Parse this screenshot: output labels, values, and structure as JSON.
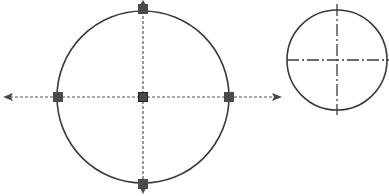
{
  "diagram": {
    "colors": {
      "stroke": "#3a3a3a",
      "handle": "#4a4a4a",
      "dashed": "#555555",
      "background": "#ffffff"
    },
    "large_circle": {
      "cx": 143,
      "cy": 97,
      "r": 86,
      "handles": [
        {
          "name": "top",
          "x": 143,
          "y": 9
        },
        {
          "name": "bottom",
          "x": 143,
          "y": 184
        },
        {
          "name": "left",
          "x": 58,
          "y": 97
        },
        {
          "name": "right",
          "x": 229,
          "y": 97
        },
        {
          "name": "center",
          "x": 143,
          "y": 97
        }
      ],
      "arrows": [
        {
          "direction": "left",
          "x1": 58,
          "y1": 97,
          "x2": 5,
          "y2": 97
        },
        {
          "direction": "right",
          "x1": 229,
          "y1": 97,
          "x2": 280,
          "y2": 97
        }
      ]
    },
    "small_circle": {
      "cx": 337,
      "cy": 60,
      "r": 50,
      "centerline_h": {
        "x1": 287,
        "x2": 389,
        "y": 60
      },
      "centerline_v": {
        "x": 337,
        "y1": 4,
        "y2": 115
      }
    }
  }
}
